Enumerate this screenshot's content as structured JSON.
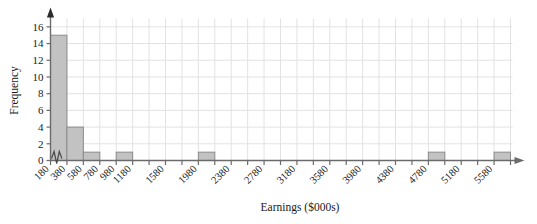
{
  "chart_data": {
    "type": "bar",
    "title": "",
    "subtitle": "",
    "xlabel": "Earnings ($000s)",
    "ylabel": "Frequency",
    "grid": true,
    "legend": "none",
    "bin_width": 200,
    "xlim": [
      180,
      5780
    ],
    "ylim": [
      0,
      17
    ],
    "y_axis_break": true,
    "y_ticks": [
      0,
      2,
      4,
      6,
      8,
      10,
      12,
      14,
      16
    ],
    "x_ticks": [
      180,
      380,
      580,
      780,
      980,
      1180,
      1380,
      1580,
      1780,
      1980,
      2180,
      2380,
      2580,
      2780,
      2980,
      3180,
      3380,
      3580,
      3780,
      3980,
      4180,
      4380,
      4580,
      4780,
      4980,
      5180,
      5380,
      5580,
      5780
    ],
    "x_tick_labels": [
      "180",
      "380",
      "580",
      "780",
      "980",
      "1180",
      "",
      "1580",
      "",
      "1980",
      "",
      "2380",
      "",
      "2780",
      "",
      "3180",
      "",
      "3580",
      "",
      "3980",
      "",
      "4380",
      "",
      "4780",
      "",
      "5180",
      "",
      "5580",
      ""
    ],
    "categories": [
      "180-380",
      "380-580",
      "580-780",
      "780-980",
      "980-1180",
      "1180-1380",
      "1380-1580",
      "1580-1780",
      "1780-1980",
      "1980-2180",
      "2180-2380",
      "2380-2580",
      "2580-2780",
      "2780-2980",
      "2980-3180",
      "3180-3380",
      "3380-3580",
      "3580-3780",
      "3780-3980",
      "3980-4180",
      "4180-4380",
      "4380-4580",
      "4580-4780",
      "4780-4980",
      "4980-5180",
      "5180-5380",
      "5380-5580",
      "5580-5780"
    ],
    "values": [
      15,
      4,
      1,
      0,
      1,
      0,
      0,
      0,
      0,
      1,
      0,
      0,
      0,
      0,
      0,
      0,
      0,
      0,
      0,
      0,
      0,
      0,
      0,
      1,
      0,
      0,
      0,
      1
    ],
    "bar_color": "#c2c2c2",
    "bar_edge_color": "#8c8c8c",
    "grid_color": "#e2e2e2",
    "axis_color": "#6b6b6b"
  }
}
